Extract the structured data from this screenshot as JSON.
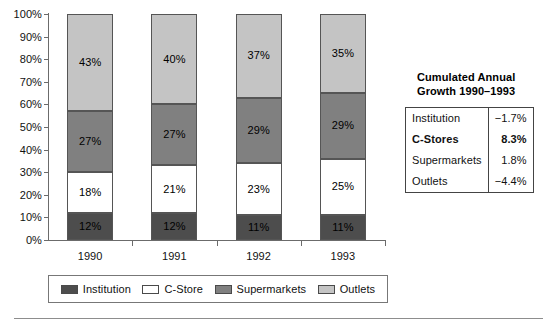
{
  "chart_data": {
    "type": "bar",
    "subtype": "stacked-100-percent",
    "title": "",
    "xlabel": "",
    "ylabel": "",
    "categories": [
      "1990",
      "1991",
      "1992",
      "1993"
    ],
    "ylim": [
      0,
      100
    ],
    "y_ticks": [
      "0%",
      "10%",
      "20%",
      "30%",
      "40%",
      "50%",
      "60%",
      "70%",
      "80%",
      "90%",
      "100%"
    ],
    "grid": false,
    "legend_position": "bottom",
    "series": [
      {
        "name": "Institution",
        "color": "#4d4d4d",
        "values": [
          12,
          12,
          11,
          11
        ],
        "labels": [
          "12%",
          "12%",
          "11%",
          "11%"
        ]
      },
      {
        "name": "C-Store",
        "color": "#ffffff",
        "values": [
          18,
          21,
          23,
          25
        ],
        "labels": [
          "18%",
          "21%",
          "23%",
          "25%"
        ]
      },
      {
        "name": "Supermarkets",
        "color": "#808080",
        "values": [
          27,
          27,
          29,
          29
        ],
        "labels": [
          "27%",
          "27%",
          "29%",
          "29%"
        ]
      },
      {
        "name": "Outlets",
        "color": "#c4c4c4",
        "values": [
          43,
          40,
          37,
          35
        ],
        "labels": [
          "43%",
          "40%",
          "37%",
          "35%"
        ]
      }
    ]
  },
  "legend": {
    "items": [
      {
        "label": "Institution",
        "swatch": "#4d4d4d"
      },
      {
        "label": "C-Store",
        "swatch": "#ffffff"
      },
      {
        "label": "Supermarkets",
        "swatch": "#808080"
      },
      {
        "label": "Outlets",
        "swatch": "#c4c4c4"
      }
    ]
  },
  "growth_panel": {
    "title_line1": "Cumulated Annual",
    "title_line2": "Growth 1990–1993",
    "rows": [
      {
        "name": "Institution",
        "value": "−1.7%",
        "emphasis": false
      },
      {
        "name": "C-Stores",
        "value": "8.3%",
        "emphasis": true
      },
      {
        "name": "Supermarkets",
        "value": "1.8%",
        "emphasis": false
      },
      {
        "name": "Outlets",
        "value": "−4.4%",
        "emphasis": false
      }
    ]
  }
}
